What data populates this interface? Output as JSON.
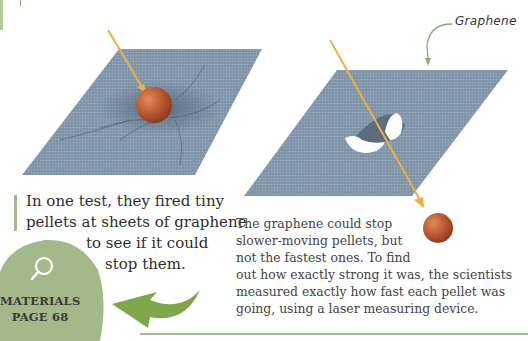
{
  "page": {
    "callout_label": "Graphene",
    "intro_text": {
      "line1": "In one test, they fired tiny",
      "line2": "pellets at sheets of graphene",
      "line3": "to see if it could",
      "line4": "stop them."
    },
    "body_text": {
      "line1": "The graphene could stop",
      "line2": "slower-moving pellets, but",
      "line3": "not the fastest ones. To find",
      "line4": "out how exactly strong it was, the scientists",
      "line5": "measured exactly how fast each pellet was",
      "line6": "going, using a laser measuring device."
    },
    "cross_reference": {
      "icon": "magnifier-icon",
      "topic": "MATERIALS",
      "page": "PAGE 68"
    },
    "illustrations": {
      "left": "graphene sheet stretching around pellet",
      "right": "graphene sheet pierced by pellet"
    },
    "colors": {
      "accent_green": "#a4b98a",
      "sheet_blue": "#7f93a8",
      "pellet": "#b0522e",
      "trajectory": "#f0b040"
    }
  }
}
